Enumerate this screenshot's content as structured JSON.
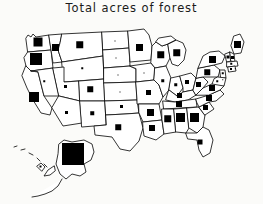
{
  "figure": {
    "title": "Total acres of forest",
    "background_color": "#fbfbf9",
    "ink_color": "#000000",
    "outline_color": "#101010",
    "style": "hand-drawn cartogram of the United States with a filled black square in each state sized in proportion to its forest acreage"
  },
  "artifacts": {
    "bottom_bleed_text": ""
  },
  "chart_data": {
    "type": "map",
    "subtype": "proportional-symbol cartogram",
    "title": "Total acres of forest",
    "xlabel": "",
    "ylabel": "",
    "symbol": "filled black square",
    "symbol_encoding": "square side length is proportional to the state's total acres of forest",
    "legend": null,
    "grid": false,
    "units": "relative symbol size (square side, px)",
    "categories": [
      "Washington",
      "Oregon",
      "California",
      "Idaho",
      "Nevada",
      "Montana",
      "Wyoming",
      "Utah",
      "Arizona",
      "Colorado",
      "New Mexico",
      "North Dakota",
      "South Dakota",
      "Nebraska",
      "Kansas",
      "Oklahoma",
      "Texas",
      "Minnesota",
      "Iowa",
      "Missouri",
      "Arkansas",
      "Louisiana",
      "Wisconsin",
      "Illinois",
      "Michigan",
      "Indiana",
      "Ohio",
      "Kentucky",
      "Tennessee",
      "Mississippi",
      "Alabama",
      "Georgia",
      "Florida",
      "South Carolina",
      "North Carolina",
      "Virginia",
      "West Virginia",
      "Pennsylvania",
      "New York",
      "Maine",
      "Vermont",
      "New Hampshire",
      "Massachusetts",
      "Connecticut",
      "Rhode Island",
      "New Jersey",
      "Delaware",
      "Maryland",
      "Alaska",
      "Hawaii"
    ],
    "values": [
      9,
      12,
      10,
      7,
      2,
      7,
      2,
      3,
      3,
      6,
      4,
      1,
      1,
      1,
      1,
      3,
      6,
      7,
      1,
      5,
      7,
      6,
      7,
      3,
      7,
      3,
      4,
      5,
      6,
      7,
      9,
      9,
      5,
      5,
      6,
      6,
      5,
      6,
      7,
      7,
      3,
      3,
      2,
      2,
      1,
      2,
      1,
      2,
      22,
      2
    ],
    "notes": [
      "Alaska carries by far the largest square, drawn larger than its own state outline",
      "Oregon, California and Washington are the largest squares in the lower 48",
      "Georgia, Alabama and Mississippi are the largest squares in the Southeast",
      "The Great Plains states (Dakotas, Nebraska, Kansas, Iowa) and Nevada, Wyoming show only tiny dots",
      "Hawaii is drawn as a small island chain with a tiny marker"
    ]
  }
}
